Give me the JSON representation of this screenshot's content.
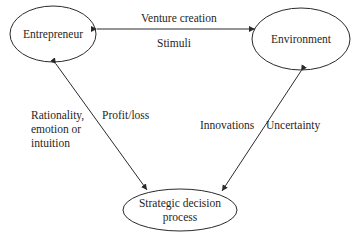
{
  "diagram": {
    "nodes": [
      {
        "id": "entrepreneur",
        "label": "Entrepreneur"
      },
      {
        "id": "environment",
        "label": "Environment"
      },
      {
        "id": "strategic_decision_process",
        "label_line1": "Strategic decision",
        "label_line2": "process"
      }
    ],
    "edges": [
      {
        "from": "entrepreneur",
        "to": "environment",
        "bidirectional": true,
        "label_above": "Venture creation",
        "label_below": "Stimuli"
      },
      {
        "from": "entrepreneur",
        "to": "strategic_decision_process",
        "bidirectional": true,
        "label_left_line1": "Rationality,",
        "label_left_line2": "emotion or",
        "label_left_line3": "intuition",
        "label_right": "Profit/loss"
      },
      {
        "from": "environment",
        "to": "strategic_decision_process",
        "bidirectional": true,
        "label_left": "Innovations",
        "label_right": "Uncertainty"
      }
    ],
    "colors": {
      "stroke": "#2a2a2a",
      "background": "#ffffff",
      "text": "#1f1f1f"
    }
  }
}
